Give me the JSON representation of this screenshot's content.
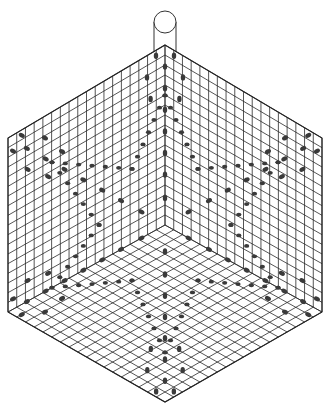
{
  "figure": {
    "title": "Hexagonal beaded snowflake pattern",
    "colors": {
      "background": "#ffffff",
      "line": "#2a2a2a",
      "bead": "#3a3a3a"
    }
  },
  "hexagon": {
    "center": [
      165,
      225
    ],
    "vertices": [
      [
        165,
        45
      ],
      [
        322,
        138
      ],
      [
        322,
        312
      ],
      [
        165,
        402
      ],
      [
        8,
        312
      ],
      [
        8,
        138
      ]
    ],
    "divisions": 18
  },
  "hanger": {
    "cx": 165,
    "cy": 22,
    "r": 11,
    "bottom": 52
  },
  "motif": {
    "arms": 6,
    "arm_cells": [
      [
        0.15,
        0
      ],
      [
        0.28,
        0
      ],
      [
        0.4,
        0
      ],
      [
        0.52,
        0
      ],
      [
        0.64,
        0
      ],
      [
        0.76,
        0
      ],
      [
        0.88,
        0
      ],
      [
        0.7,
        0.08
      ],
      [
        0.7,
        -0.08
      ],
      [
        0.82,
        0.1
      ],
      [
        0.82,
        -0.1
      ],
      [
        0.94,
        0.05
      ],
      [
        0.94,
        -0.05
      ]
    ],
    "star_points": 6,
    "star_outer": 0.72,
    "star_inner": 0.42
  }
}
